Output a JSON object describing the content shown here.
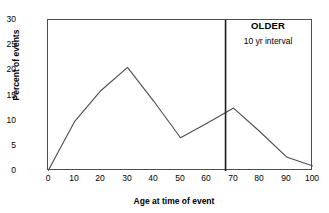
{
  "chart_data": {
    "type": "line",
    "title": "",
    "xlabel": "Age at time of event",
    "ylabel": "Percent of events",
    "x": [
      0,
      10,
      20,
      30,
      40,
      50,
      60,
      70,
      80,
      90,
      100
    ],
    "values": [
      0,
      9.8,
      16.0,
      20.6,
      13.8,
      6.6,
      9.5,
      12.5,
      7.8,
      2.8,
      1.0
    ],
    "series": [
      {
        "name": "Percent of events",
        "values": [
          0,
          9.8,
          16.0,
          20.6,
          13.8,
          6.6,
          9.5,
          12.5,
          7.8,
          2.8,
          1.0
        ]
      }
    ],
    "xlim": [
      0,
      100
    ],
    "ylim": [
      0,
      30
    ],
    "xticks": [
      "0",
      "10",
      "20",
      "30",
      "40",
      "50",
      "60",
      "70",
      "80",
      "90",
      "100"
    ],
    "yticks": [
      "0",
      "5",
      "10",
      "15",
      "20",
      "25",
      "30"
    ],
    "grid": false,
    "legend": false,
    "annotations": [
      {
        "name": "older-divider",
        "type": "vline",
        "x": 67,
        "label_primary": "OLDER",
        "label_secondary": "10 yr interval"
      }
    ],
    "colors": {
      "line": "#4d4d4d",
      "axis": "#4d4d4d",
      "divider": "#1a1a1a",
      "text": "#000000",
      "background": "#ffffff"
    }
  }
}
